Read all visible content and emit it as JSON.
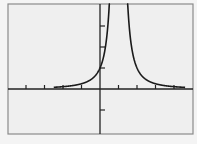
{
  "chart_data": {
    "type": "line",
    "title": "",
    "xlabel": "",
    "ylabel": "",
    "function": "y = 1/(x-1)^2",
    "vertical_asymptote": 1,
    "xlim": [
      -5,
      5
    ],
    "ylim": [
      -1.2,
      4
    ],
    "x_ticks": [
      -4,
      -3,
      -2,
      -1,
      1,
      2,
      3,
      4
    ],
    "y_ticks": [
      -1,
      1,
      2,
      3
    ],
    "grid": false,
    "legend": null
  },
  "colors": {
    "background": "#f0f0f0",
    "frame": "#8a8a8a",
    "axis": "#222222",
    "curve": "#1a1a1a"
  }
}
